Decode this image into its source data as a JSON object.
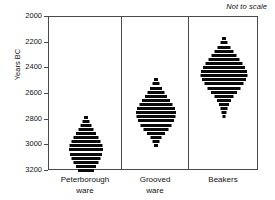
{
  "annotation": {
    "note": "Not to scale"
  },
  "axis": {
    "ylabel": "Years BC",
    "ticks": [
      2000,
      2200,
      2400,
      2600,
      2800,
      3000,
      3200
    ]
  },
  "categories": [
    {
      "line1": "Peterborough",
      "line2": "ware"
    },
    {
      "line1": "Grooved",
      "line2": "ware"
    },
    {
      "line1": "Beakers",
      "line2": ""
    }
  ],
  "chart_data": {
    "type": "bar",
    "title": "",
    "subtitle": "Not to scale",
    "xlabel": "",
    "ylabel": "Years BC",
    "ylim": [
      2000,
      3200
    ],
    "y_inverted": true,
    "yticks": [
      2000,
      2200,
      2400,
      2600,
      2800,
      3000,
      3200
    ],
    "grid": false,
    "legend": null,
    "orientation": "horizontal-rows",
    "categories": [
      "Peterborough ware",
      "Grooved ware",
      "Beakers"
    ],
    "series": [
      {
        "name": "Peterborough ware",
        "center_x_px": 85,
        "range_bc": [
          2780,
          3200
        ],
        "peak_bc": 3040,
        "rows": [
          {
            "year": 2780,
            "width": 4
          },
          {
            "year": 2812,
            "width": 7
          },
          {
            "year": 2844,
            "width": 11
          },
          {
            "year": 2876,
            "width": 15
          },
          {
            "year": 2908,
            "width": 20
          },
          {
            "year": 2940,
            "width": 25
          },
          {
            "year": 2972,
            "width": 29
          },
          {
            "year": 3004,
            "width": 33
          },
          {
            "year": 3036,
            "width": 34
          },
          {
            "year": 3068,
            "width": 32
          },
          {
            "year": 3100,
            "width": 29
          },
          {
            "year": 3132,
            "width": 25
          },
          {
            "year": 3164,
            "width": 20
          },
          {
            "year": 3196,
            "width": 16
          }
        ]
      },
      {
        "name": "Grooved ware",
        "center_x_px": 155,
        "range_bc": [
          2490,
          3010
        ],
        "peak_bc": 2750,
        "rows": [
          {
            "year": 2490,
            "width": 4
          },
          {
            "year": 2522,
            "width": 7
          },
          {
            "year": 2554,
            "width": 12
          },
          {
            "year": 2586,
            "width": 17
          },
          {
            "year": 2618,
            "width": 22
          },
          {
            "year": 2650,
            "width": 28
          },
          {
            "year": 2682,
            "width": 33
          },
          {
            "year": 2714,
            "width": 38
          },
          {
            "year": 2746,
            "width": 40
          },
          {
            "year": 2778,
            "width": 39
          },
          {
            "year": 2810,
            "width": 36
          },
          {
            "year": 2842,
            "width": 31
          },
          {
            "year": 2874,
            "width": 25
          },
          {
            "year": 2906,
            "width": 18
          },
          {
            "year": 2938,
            "width": 11
          },
          {
            "year": 2970,
            "width": 7
          },
          {
            "year": 3002,
            "width": 4
          }
        ]
      },
      {
        "name": "Beakers",
        "center_x_px": 223,
        "range_bc": [
          2170,
          2790
        ],
        "peak_bc": 2450,
        "rows": [
          {
            "year": 2170,
            "width": 4
          },
          {
            "year": 2202,
            "width": 7
          },
          {
            "year": 2234,
            "width": 13
          },
          {
            "year": 2266,
            "width": 19
          },
          {
            "year": 2298,
            "width": 25
          },
          {
            "year": 2330,
            "width": 31
          },
          {
            "year": 2362,
            "width": 37
          },
          {
            "year": 2394,
            "width": 42
          },
          {
            "year": 2426,
            "width": 46
          },
          {
            "year": 2458,
            "width": 47
          },
          {
            "year": 2490,
            "width": 44
          },
          {
            "year": 2522,
            "width": 39
          },
          {
            "year": 2554,
            "width": 33
          },
          {
            "year": 2586,
            "width": 26
          },
          {
            "year": 2618,
            "width": 19
          },
          {
            "year": 2650,
            "width": 14
          },
          {
            "year": 2682,
            "width": 10
          },
          {
            "year": 2714,
            "width": 7
          },
          {
            "year": 2746,
            "width": 5
          },
          {
            "year": 2778,
            "width": 3
          }
        ]
      }
    ]
  }
}
